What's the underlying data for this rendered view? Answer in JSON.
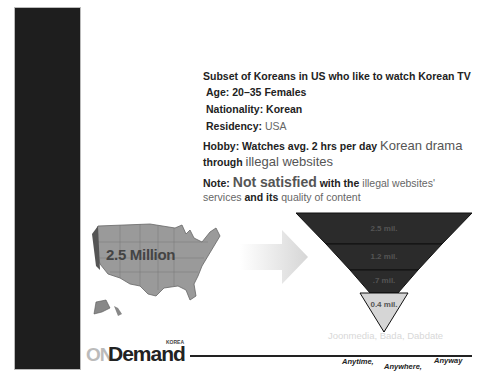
{
  "slide": {
    "heading": "Subset of Koreans in US who like to watch Korean TV",
    "age": {
      "label": "Age:",
      "value": "20–35 Females"
    },
    "nationality": {
      "label": "Nationality:",
      "value": "Korean"
    },
    "residency": {
      "label": "Residency:",
      "value": "USA"
    },
    "hobby": {
      "label": "Hobby:",
      "text1": "Watches avg. 2 hrs per day",
      "emph1": "Korean drama",
      "text2": "through",
      "emph2": "illegal websites"
    },
    "note": {
      "label": "Note:",
      "emph1": "Not satisfied",
      "text1": "with the",
      "text2": "illegal websites'",
      "text3": "services",
      "text4": "and its",
      "text5": "quality of content"
    }
  },
  "map": {
    "label": "2.5 Million",
    "icon": "usa-map-icon",
    "arrow_icon": "right-arrow-icon"
  },
  "funnel": {
    "levels": [
      {
        "label": "2.5 mil.",
        "fill": "#2b2b2b"
      },
      {
        "label": "1.2 mil.",
        "fill": "#2b2b2b"
      },
      {
        "label": ".7 mil.",
        "fill": "#2b2b2b"
      },
      {
        "label": "0.4 mil.",
        "fill": "#d6d6d6"
      }
    ],
    "source": "Joonmedia, Bada, Dabdate"
  },
  "footer": {
    "logo_on": "ON",
    "logo_demand": "Demand",
    "logo_korea": "KOREA",
    "tagline": [
      "Anytime,",
      "Anywhere,",
      "Anyway"
    ]
  },
  "colors": {
    "sidebar": "#1e1e1e",
    "funnel_dark": "#2b2b2b",
    "funnel_light": "#d6d6d6",
    "map_gray": "#9a9a9a"
  }
}
